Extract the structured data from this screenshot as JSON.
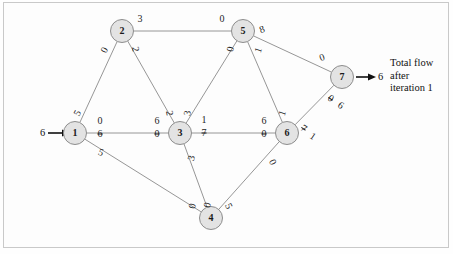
{
  "diagram": {
    "title_text": "Total flow after iteration 1",
    "nodes": [
      {
        "id": "1",
        "label": "1",
        "x": 75,
        "y": 133
      },
      {
        "id": "2",
        "label": "2",
        "x": 122,
        "y": 31
      },
      {
        "id": "3",
        "label": "3",
        "x": 180,
        "y": 133
      },
      {
        "id": "4",
        "label": "4",
        "x": 211,
        "y": 218
      },
      {
        "id": "5",
        "label": "5",
        "x": 243,
        "y": 31
      },
      {
        "id": "6",
        "label": "6",
        "x": 287,
        "y": 133
      },
      {
        "id": "7",
        "label": "7",
        "x": 342,
        "y": 77
      }
    ],
    "edges": [
      {
        "from": "1",
        "to": "2"
      },
      {
        "from": "1",
        "to": "3"
      },
      {
        "from": "1",
        "to": "4"
      },
      {
        "from": "2",
        "to": "5"
      },
      {
        "from": "2",
        "to": "3"
      },
      {
        "from": "3",
        "to": "5"
      },
      {
        "from": "3",
        "to": "6"
      },
      {
        "from": "3",
        "to": "4"
      },
      {
        "from": "5",
        "to": "6"
      },
      {
        "from": "5",
        "to": "7"
      },
      {
        "from": "4",
        "to": "6"
      },
      {
        "from": "6",
        "to": "7"
      }
    ],
    "edge_labels": [
      {
        "name": "label-1-2-near2",
        "text": "0",
        "x": 104,
        "y": 50,
        "rot": -62,
        "strike": false
      },
      {
        "name": "label-1-2-near1",
        "text": "5",
        "x": 77,
        "y": 113,
        "rot": -62,
        "strike": false
      },
      {
        "name": "label-1-3-new",
        "text": "0",
        "x": 100,
        "y": 120,
        "rot": 0,
        "strike": false
      },
      {
        "name": "label-1-3-old",
        "text": "6",
        "x": 100,
        "y": 133,
        "rot": 0,
        "strike": true
      },
      {
        "name": "label-3-1-new",
        "text": "6",
        "x": 157,
        "y": 120,
        "rot": 0,
        "strike": false
      },
      {
        "name": "label-3-1-old",
        "text": "0",
        "x": 157,
        "y": 133,
        "rot": 0,
        "strike": true
      },
      {
        "name": "label-1-4-near1",
        "text": "5",
        "x": 101,
        "y": 152,
        "rot": 20,
        "strike": false
      },
      {
        "name": "label-1-4-near4",
        "text": "0",
        "x": 192,
        "y": 206,
        "rot": -75,
        "strike": false
      },
      {
        "name": "label-2-5-near2",
        "text": "3",
        "x": 140,
        "y": 18,
        "rot": 0,
        "strike": false
      },
      {
        "name": "label-2-5-near5",
        "text": "0",
        "x": 222,
        "y": 18,
        "rot": 0,
        "strike": false
      },
      {
        "name": "label-2-3-near2",
        "text": "2",
        "x": 136,
        "y": 49,
        "rot": 80,
        "strike": false
      },
      {
        "name": "label-2-3-near3",
        "text": "2",
        "x": 170,
        "y": 113,
        "rot": 80,
        "strike": false
      },
      {
        "name": "label-3-5-near5",
        "text": "0",
        "x": 230,
        "y": 49,
        "rot": -78,
        "strike": false
      },
      {
        "name": "label-3-5-near3",
        "text": "3",
        "x": 187,
        "y": 113,
        "rot": -78,
        "strike": false
      },
      {
        "name": "label-3-6-new",
        "text": "1",
        "x": 204,
        "y": 119,
        "rot": 0,
        "strike": false
      },
      {
        "name": "label-3-6-old",
        "text": "7",
        "x": 204,
        "y": 132,
        "rot": 0,
        "strike": true
      },
      {
        "name": "label-6-3-new",
        "text": "6",
        "x": 264,
        "y": 120,
        "rot": 0,
        "strike": false
      },
      {
        "name": "label-6-3-old",
        "text": "0",
        "x": 264,
        "y": 133,
        "rot": 0,
        "strike": true
      },
      {
        "name": "label-3-4-near3",
        "text": "3",
        "x": 191,
        "y": 158,
        "rot": -75,
        "strike": false
      },
      {
        "name": "label-3-4-near4",
        "text": "0",
        "x": 207,
        "y": 205,
        "rot": -75,
        "strike": false
      },
      {
        "name": "label-5-6-near5",
        "text": "1",
        "x": 258,
        "y": 50,
        "rot": -72,
        "strike": false
      },
      {
        "name": "label-5-6-near6",
        "text": "1",
        "x": 282,
        "y": 113,
        "rot": -72,
        "strike": false
      },
      {
        "name": "label-5-7-near5",
        "text": "8",
        "x": 262,
        "y": 29,
        "rot": -20,
        "strike": false
      },
      {
        "name": "label-5-7-near7",
        "text": "0",
        "x": 322,
        "y": 57,
        "rot": -20,
        "strike": false
      },
      {
        "name": "label-4-6-near4",
        "text": "5",
        "x": 229,
        "y": 206,
        "rot": 64,
        "strike": false
      },
      {
        "name": "label-4-6-near6",
        "text": "0",
        "x": 273,
        "y": 162,
        "rot": 64,
        "strike": false
      },
      {
        "name": "label-6-7-old",
        "text": "0",
        "x": 331,
        "y": 98,
        "rot": 35,
        "strike": true
      },
      {
        "name": "label-6-7-new",
        "text": "6",
        "x": 341,
        "y": 105,
        "rot": 35,
        "strike": false
      },
      {
        "name": "label-7-6-old",
        "text": "7",
        "x": 304,
        "y": 128,
        "rot": 35,
        "strike": true
      },
      {
        "name": "label-7-6-new",
        "text": "1",
        "x": 313,
        "y": 136,
        "rot": 35,
        "strike": false
      }
    ],
    "source_inflow": {
      "value": "6",
      "x": 40,
      "y": 127
    },
    "sink_outflow": {
      "value": "6",
      "x": 378,
      "y": 71
    },
    "annotation_lines": [
      "Total flow",
      "after",
      "iteration 1"
    ]
  }
}
